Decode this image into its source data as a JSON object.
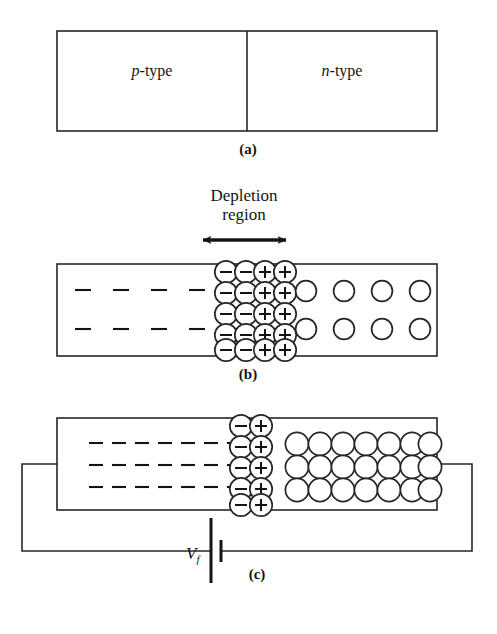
{
  "figure": {
    "stroke_color": "#262626",
    "text_color": "#141414",
    "background": "#ffffff"
  },
  "panels": [
    {
      "id": "a",
      "label": "(a)",
      "label_x": 248,
      "label_y": 142,
      "rect": {
        "x": 57,
        "y": 31,
        "w": 380,
        "h": 100
      },
      "divider_x": 247,
      "left_region": {
        "italic": "p",
        "rest": "-type",
        "x": 152,
        "y": 72
      },
      "right_region": {
        "italic": "n",
        "rest": "-type",
        "x": 342,
        "y": 72
      }
    },
    {
      "id": "b",
      "label": "(b)",
      "label_x": 248,
      "label_y": 367,
      "rect": {
        "x": 57,
        "y": 264,
        "w": 380,
        "h": 92
      },
      "depletion_label_line1": "Depletion",
      "depletion_label_line2": "region",
      "depletion_label_x": 244,
      "depletion_label_y": 186,
      "arrow": {
        "x1": 198,
        "x2": 291,
        "y": 240
      },
      "holes_rows": 2,
      "holes_cols": 4,
      "electrons_rows": 2,
      "electrons_cols": 4,
      "depletion_neg_cols": 2,
      "depletion_pos_cols": 2,
      "depletion_rows": 5
    },
    {
      "id": "c",
      "label": "(c)",
      "label_x": 253,
      "label_y": 578,
      "rect": {
        "x": 57,
        "y": 418,
        "w": 380,
        "h": 92
      },
      "dash_rows": 3,
      "dash_cols": 7,
      "electron_block_rows": 3,
      "electron_block_cols": 7,
      "depletion_neg_cols": 1,
      "depletion_pos_cols": 1,
      "depletion_rows": 5,
      "source_label_italic": "V",
      "source_label_sub": "f",
      "source_label_x": 188,
      "source_label_y": 553
    }
  ],
  "symbols": {
    "negative_sign": "−",
    "positive_sign": "+",
    "empty_circle": "circle"
  }
}
